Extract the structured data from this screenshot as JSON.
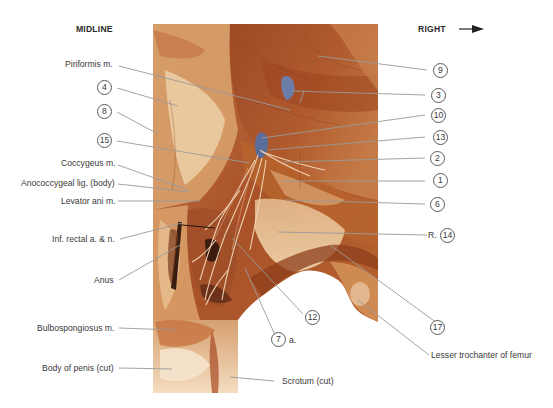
{
  "header": {
    "left": "MIDLINE",
    "right": "RIGHT",
    "right_arrow_icon": "arrow-right-icon"
  },
  "labels_left": [
    {
      "id": "piriformis",
      "text": "Piriformis m."
    },
    {
      "id": "n4",
      "num": "4"
    },
    {
      "id": "n8",
      "num": "8"
    },
    {
      "id": "n15",
      "num": "15"
    },
    {
      "id": "coccygeus",
      "text": "Coccygeus m."
    },
    {
      "id": "anococcygeal",
      "text": "Anococcygeal lig. (body)"
    },
    {
      "id": "levator",
      "text": "Levator ani m."
    },
    {
      "id": "infrectal",
      "text": "Inf. rectal a. & n."
    },
    {
      "id": "anus",
      "text": "Anus"
    },
    {
      "id": "bulbospongiosus",
      "text": "Bulbospongiosus m."
    },
    {
      "id": "penis",
      "text": "Body of penis (cut)"
    }
  ],
  "labels_right": [
    {
      "id": "n9",
      "num": "9"
    },
    {
      "id": "n3",
      "num": "3"
    },
    {
      "id": "n10",
      "num": "10"
    },
    {
      "id": "n13",
      "num": "13"
    },
    {
      "id": "n2",
      "num": "2"
    },
    {
      "id": "n1",
      "num": "1"
    },
    {
      "id": "n6",
      "num": "6"
    },
    {
      "id": "n14",
      "num": "14",
      "prefix": "R."
    },
    {
      "id": "n17",
      "num": "17"
    },
    {
      "id": "trochanter",
      "text": "Lesser trochanter of femur"
    }
  ],
  "labels_bottom": [
    {
      "id": "n12",
      "num": "12"
    },
    {
      "id": "n7",
      "num": "7",
      "suffix": "a."
    },
    {
      "id": "scrotum",
      "text": "Scrotum (cut)"
    }
  ],
  "colors": {
    "leader": "#9a9a9a",
    "muscle_dark": "#8a3a1c",
    "muscle_mid": "#b5592c",
    "fat_light": "#e9c79a",
    "fat_pale": "#f3dcbc",
    "vessel_blue": "#6c7ea8",
    "nerve": "#f1d7b8"
  }
}
